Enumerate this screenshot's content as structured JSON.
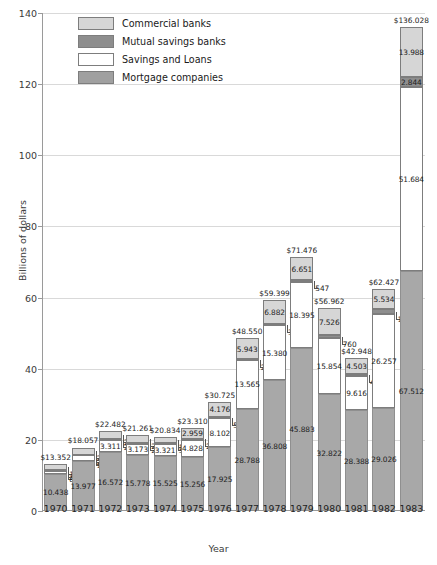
{
  "chart_data": {
    "type": "bar",
    "stacked": true,
    "title": "",
    "xlabel": "Year",
    "ylabel": "Billions of dollars",
    "ylim": [
      0,
      140
    ],
    "yticks": [
      0,
      20,
      40,
      60,
      80,
      100,
      120,
      140
    ],
    "grid": true,
    "legend_position": "top-left-inside",
    "categories": [
      "1970",
      "1971",
      "1972",
      "1973",
      "1974",
      "1975",
      "1976",
      "1977",
      "1978",
      "1979",
      "1980",
      "1981",
      "1982",
      "1983"
    ],
    "series": [
      {
        "name": "Mortgage companies",
        "values": [
          10.438,
          13.977,
          16.572,
          15.778,
          15.525,
          15.256,
          17.925,
          28.788,
          36.808,
          45.883,
          32.822,
          28.388,
          29.026,
          67.512
        ]
      },
      {
        "name": "Savings and Loans",
        "values": [
          0.896,
          1.641,
          3.311,
          3.173,
          3.321,
          4.828,
          8.102,
          13.565,
          15.38,
          18.395,
          15.854,
          9.616,
          26.257,
          51.684
        ]
      },
      {
        "name": "Mutual savings banks",
        "values": [
          0.27,
          0.234,
          0.261,
          0.225,
          0.305,
          0.267,
          0.522,
          0.254,
          0.329,
          0.547,
          0.76,
          0.441,
          1.61,
          2.844
        ]
      },
      {
        "name": "Commercial banks",
        "values": [
          1.748,
          2.005,
          2.338,
          2.085,
          1.683,
          2.959,
          4.176,
          5.943,
          6.882,
          6.651,
          7.526,
          4.503,
          5.534,
          13.988
        ]
      }
    ],
    "totals": [
      13.352,
      18.057,
      22.482,
      21.261,
      20.834,
      23.31,
      30.725,
      48.55,
      59.399,
      71.476,
      56.962,
      42.948,
      62.427,
      136.028
    ],
    "total_labels": [
      "$13.352",
      "$18.057",
      "$22.482",
      "$21.261",
      "$20.834",
      "$23.310",
      "$30.725",
      "$48.550",
      "$59.399",
      "$71.476",
      "$56.962",
      "$42.948",
      "$62.427",
      "$136.028"
    ],
    "value_labels": {
      "mortgage": [
        "10.438",
        "13.977",
        "16.572",
        "15.778",
        "15.525",
        "15.256",
        "17.925",
        "28.788",
        "36.808",
        "45.883",
        "32.822",
        "28.388",
        "29.026",
        "67.512"
      ],
      "savings": [
        "896",
        "1.641",
        "3.311",
        "3.173",
        "3.321",
        "4.828",
        "8.102",
        "13.565",
        "15.380",
        "18.395",
        "15.854",
        "9.616",
        "26.257",
        "51.684"
      ],
      "mutual": [
        "270",
        "234",
        "261",
        "225",
        "305",
        "267",
        "522",
        "254",
        "329",
        "547",
        "760",
        "441",
        "1.610",
        "2.844"
      ],
      "commercial": [
        "1.748",
        "2.005",
        "2.338",
        "2.085",
        "1.683",
        "2.959",
        "4.176",
        "5.943",
        "6.882",
        "6.651",
        "7.526",
        "4.503",
        "5.534",
        "13.988"
      ]
    },
    "colors": {
      "commercial": "#d6d6d6",
      "mutual": "#8e8e8e",
      "savings": "#ffffff",
      "mortgage": "#a8a8a8",
      "grid": "#d9d9d9",
      "axis": "#9a9a9a",
      "text": "#1a1a1a"
    }
  },
  "legend": {
    "items": [
      {
        "label": "Commercial banks",
        "key": "commercial"
      },
      {
        "label": "Mutual savings banks",
        "key": "mutual"
      },
      {
        "label": "Savings and Loans",
        "key": "savings"
      },
      {
        "label": "Mortgage companies",
        "key": "mortgage"
      }
    ]
  }
}
